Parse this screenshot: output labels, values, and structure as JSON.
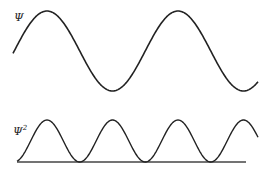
{
  "labels": {
    "psi": "Ψ",
    "psi_squared_base": "Ψ",
    "psi_squared_exp": "2"
  },
  "colors": {
    "line": "#222222",
    "background": "#ffffff"
  },
  "chart_data": [
    {
      "type": "line",
      "title": "",
      "ylabel": "Ψ",
      "description": "Sinusoidal wavefunction, ~2 full periods",
      "function": "sin(x)",
      "x_range_periods": [
        0,
        2.1
      ]
    },
    {
      "type": "line",
      "title": "",
      "ylabel": "Ψ²",
      "description": "Probability density sin²(x), non-negative humps touching baseline",
      "function": "sin^2(x)",
      "peaks": 4,
      "baseline": true
    }
  ]
}
